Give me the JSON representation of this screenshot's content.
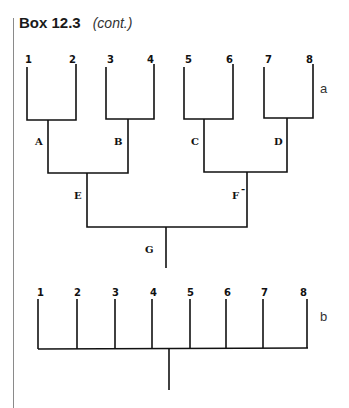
{
  "header": {
    "box_label": "Box 12.3",
    "cont_label": "(cont.)"
  },
  "tree_a": {
    "panel_label": "a",
    "leaves": [
      "1",
      "2",
      "3",
      "4",
      "5",
      "6",
      "7",
      "8"
    ],
    "internal_nodes": {
      "A": "A",
      "B": "B",
      "C": "C",
      "D": "D",
      "E": "E",
      "F": "F",
      "F_mark": "-",
      "G": "G"
    }
  },
  "tree_b": {
    "panel_label": "b",
    "leaves": [
      "1",
      "2",
      "3",
      "4",
      "5",
      "6",
      "7",
      "8"
    ]
  }
}
